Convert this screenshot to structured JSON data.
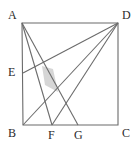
{
  "figure": {
    "type": "geometry-diagram",
    "width": 137,
    "height": 147,
    "background_color": "#ffffff",
    "stroke_color": "#6b6b6b",
    "stroke_width": 1.1,
    "shade_fill": "#d6d6d6",
    "label_color": "#2b2b2b",
    "label_font_size": 12
  },
  "points": {
    "A": {
      "label": "A",
      "x": 22,
      "y": 23,
      "label_x": 8,
      "label_y": 9
    },
    "B": {
      "label": "B",
      "x": 23,
      "y": 125,
      "label_x": 8,
      "label_y": 127
    },
    "C": {
      "label": "C",
      "x": 118,
      "y": 125,
      "label_x": 122,
      "label_y": 127
    },
    "D": {
      "label": "D",
      "x": 118,
      "y": 23,
      "label_x": 122,
      "label_y": 9
    },
    "E": {
      "label": "E",
      "x": 23,
      "y": 73,
      "label_x": 8,
      "label_y": 66
    },
    "F": {
      "label": "F",
      "x": 52,
      "y": 125,
      "label_x": 48,
      "label_y": 129
    },
    "G": {
      "label": "G",
      "x": 78,
      "y": 125,
      "label_x": 74,
      "label_y": 129
    }
  },
  "square": {
    "name": "square-ABCD",
    "path": "M 22 23 L 118 23 L 118 125 L 23 125 Z"
  },
  "segments": [
    {
      "name": "segment-A-F",
      "from": "A",
      "to": "F",
      "path": "M 22 23 L 52 125"
    },
    {
      "name": "segment-A-G",
      "from": "A",
      "to": "G",
      "path": "M 22 23 L 78 125"
    },
    {
      "name": "segment-B-D",
      "from": "B",
      "to": "D",
      "path": "M 23 125 L 118 23"
    },
    {
      "name": "segment-E-D",
      "from": "E",
      "to": "D",
      "path": "M 23 73 L 118 23"
    },
    {
      "name": "segment-D-F",
      "from": "D",
      "to": "F",
      "path": "M 118 23 L 52 125"
    }
  ],
  "shaded_region": {
    "name": "shaded-quadrilateral",
    "path": "M 42 66 L 53 69 L 58 92 L 45 85 Z"
  },
  "labels_order": [
    "A",
    "D",
    "E",
    "B",
    "F",
    "G",
    "C"
  ]
}
